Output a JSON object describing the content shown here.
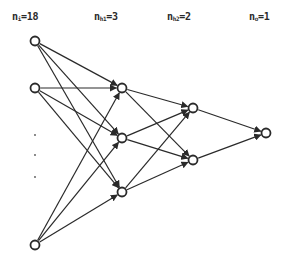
{
  "diagram": {
    "type": "feedforward neural network",
    "layers": [
      {
        "id": "input",
        "label_base": "n",
        "label_sub": "i",
        "label_value": "=18",
        "count": 18,
        "visible_nodes": 3,
        "ellipsis": true,
        "x": 35,
        "label_x": 12
      },
      {
        "id": "hidden1",
        "label_base": "n",
        "label_sub": "h1",
        "label_value": "=3",
        "count": 3,
        "visible_nodes": 3,
        "x": 122,
        "label_x": 94
      },
      {
        "id": "hidden2",
        "label_base": "n",
        "label_sub": "h2",
        "label_value": "=2",
        "count": 2,
        "visible_nodes": 2,
        "x": 193,
        "label_x": 167
      },
      {
        "id": "output",
        "label_base": "n",
        "label_sub": "o",
        "label_value": "=1",
        "count": 1,
        "visible_nodes": 1,
        "x": 266,
        "label_x": 249
      }
    ],
    "nodes": {
      "input": [
        [
          35,
          41
        ],
        [
          35,
          88
        ],
        [
          35,
          245
        ]
      ],
      "ellipsis_dots": [
        [
          35,
          135
        ],
        [
          35,
          155
        ],
        [
          35,
          177
        ]
      ],
      "hidden1": [
        [
          122,
          88
        ],
        [
          122,
          138
        ],
        [
          122,
          192
        ]
      ],
      "hidden2": [
        [
          193,
          108
        ],
        [
          193,
          160
        ]
      ],
      "output": [
        [
          266,
          133
        ]
      ]
    },
    "connectivity": "fully connected between adjacent layers, directed left to right with arrowheads",
    "colors": {
      "stroke": "#2a2a2a",
      "background": "#ffffff"
    }
  }
}
